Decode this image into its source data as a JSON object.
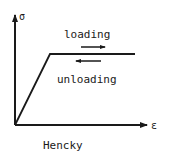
{
  "diagram": {
    "title": "Hencky",
    "y_axis_label": "σ",
    "x_axis_label": "ε",
    "loading_label": "loading",
    "unloading_label": "unloading",
    "line_color": "#1a1a1a"
  }
}
